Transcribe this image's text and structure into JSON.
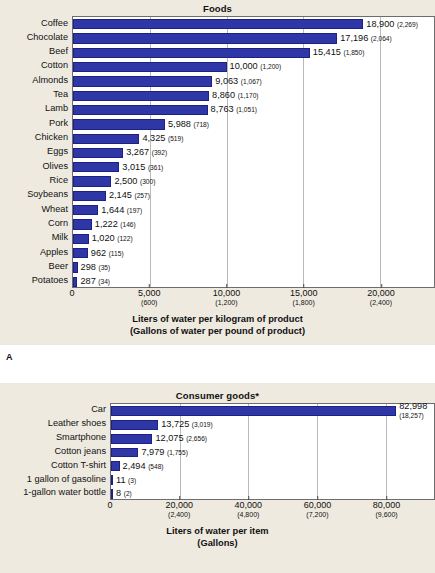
{
  "figure_label": "A",
  "colors": {
    "bar_fill": "#2f36a6",
    "bar_stroke": "#1c2183",
    "panel_background": "#eeeae0",
    "plot_background": "#ffffff",
    "gridline": "#b9b9b9",
    "text": "#111111"
  },
  "chart_data": [
    {
      "type": "bar",
      "orientation": "horizontal",
      "title": "Foods",
      "xlabel": "Liters of water per kilogram of product",
      "xlabel_sub": "(Gallons of water per pound of product)",
      "ylabel": "",
      "xlim": [
        0,
        23500
      ],
      "grid": true,
      "legend": "none",
      "xticks": [
        {
          "value": 0,
          "label": "0",
          "sublabel": ""
        },
        {
          "value": 5000,
          "label": "5,000",
          "sublabel": "(600)"
        },
        {
          "value": 10000,
          "label": "10,000",
          "sublabel": "(1,200)"
        },
        {
          "value": 15000,
          "label": "15,000",
          "sublabel": "(1,800)"
        },
        {
          "value": 20000,
          "label": "20,000",
          "sublabel": "(2,400)"
        }
      ],
      "categories": [
        "Coffee",
        "Chocolate",
        "Beef",
        "Cotton",
        "Almonds",
        "Tea",
        "Lamb",
        "Pork",
        "Chicken",
        "Eggs",
        "Olives",
        "Rice",
        "Soybeans",
        "Wheat",
        "Corn",
        "Milk",
        "Apples",
        "Beer",
        "Potatoes"
      ],
      "values": [
        18900,
        17196,
        15415,
        10000,
        9063,
        8860,
        8763,
        5988,
        4325,
        3267,
        3015,
        2500,
        2145,
        1644,
        1222,
        1020,
        962,
        298,
        287
      ],
      "value_labels": [
        "18,900",
        "17,196",
        "15,415",
        "10,000",
        "9,063",
        "8,860",
        "8,763",
        "5,988",
        "4,325",
        "3,267",
        "3,015",
        "2,500",
        "2,145",
        "1,644",
        "1,222",
        "1,020",
        "962",
        "298",
        "287"
      ],
      "value_labels_secondary": [
        "(2,269)",
        "(2,064)",
        "(1,850)",
        "(1,200)",
        "(1,067)",
        "(1,170)",
        "(1,051)",
        "(718)",
        "(519)",
        "(392)",
        "(361)",
        "(300)",
        "(257)",
        "(197)",
        "(146)",
        "(122)",
        "(115)",
        "(35)",
        "(34)"
      ]
    },
    {
      "type": "bar",
      "orientation": "horizontal",
      "title": "Consumer goods*",
      "xlabel": "Liters of water per item",
      "xlabel_sub": "(Gallons)",
      "ylabel": "",
      "xlim": [
        0,
        94000
      ],
      "grid": true,
      "legend": "none",
      "xticks": [
        {
          "value": 0,
          "label": "0",
          "sublabel": ""
        },
        {
          "value": 20000,
          "label": "20,000",
          "sublabel": "(2,400)"
        },
        {
          "value": 40000,
          "label": "40,000",
          "sublabel": "(4,800)"
        },
        {
          "value": 60000,
          "label": "60,000",
          "sublabel": "(7,200)"
        },
        {
          "value": 80000,
          "label": "80,000",
          "sublabel": "(9,600)"
        }
      ],
      "categories": [
        "Car",
        "Leather shoes",
        "Smartphone",
        "Cotton jeans",
        "Cotton T-shirt",
        "1 gallon of gasoline",
        "1-gallon water bottle"
      ],
      "values": [
        82998,
        13725,
        12075,
        7979,
        2494,
        11,
        8
      ],
      "value_labels": [
        "82,998",
        "13,725",
        "12,075",
        "7,979",
        "2,494",
        "11",
        "8"
      ],
      "value_labels_secondary": [
        "(18,257)",
        "(3,019)",
        "(2,656)",
        "(1,755)",
        "(548)",
        "(3)",
        "(2)"
      ]
    }
  ]
}
